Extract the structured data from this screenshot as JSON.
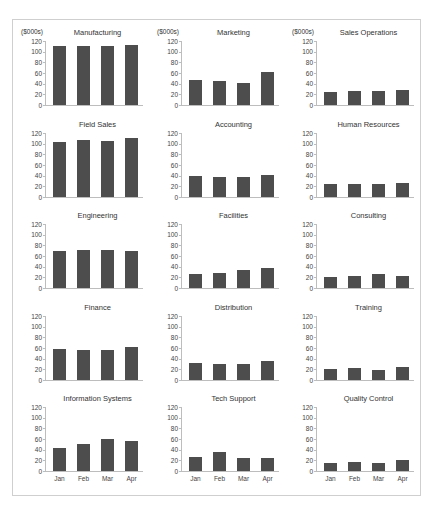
{
  "page": {
    "units_label": "($000s)",
    "month_labels": [
      "Jan",
      "Feb",
      "Mar",
      "Apr"
    ],
    "y_ticks": [
      "120",
      "100",
      "80",
      "60",
      "40",
      "20",
      "0"
    ],
    "bar_color": "#4d4d4d",
    "axis_color": "#bdbdbd",
    "frame_border_color": "#cfcfcf"
  },
  "chart_data": [
    {
      "type": "bar",
      "title": "Manufacturing",
      "ylabel": "($000s)",
      "categories": [
        "Jan",
        "Feb",
        "Mar",
        "Apr"
      ],
      "values": [
        110,
        111,
        110,
        113
      ],
      "ylim": [
        0,
        120
      ]
    },
    {
      "type": "bar",
      "title": "Marketing",
      "ylabel": "($000s)",
      "categories": [
        "Jan",
        "Feb",
        "Mar",
        "Apr"
      ],
      "values": [
        46,
        45,
        42,
        62
      ],
      "ylim": [
        0,
        120
      ]
    },
    {
      "type": "bar",
      "title": "Sales Operations",
      "ylabel": "($000s)",
      "categories": [
        "Jan",
        "Feb",
        "Mar",
        "Apr"
      ],
      "values": [
        25,
        27,
        27,
        28
      ],
      "ylim": [
        0,
        120
      ]
    },
    {
      "type": "bar",
      "title": "Field Sales",
      "ylabel": "",
      "categories": [
        "Jan",
        "Feb",
        "Mar",
        "Apr"
      ],
      "values": [
        103,
        106,
        105,
        111
      ],
      "ylim": [
        0,
        120
      ]
    },
    {
      "type": "bar",
      "title": "Accounting",
      "ylabel": "",
      "categories": [
        "Jan",
        "Feb",
        "Mar",
        "Apr"
      ],
      "values": [
        39,
        37,
        38,
        41
      ],
      "ylim": [
        0,
        120
      ]
    },
    {
      "type": "bar",
      "title": "Human Resources",
      "ylabel": "",
      "categories": [
        "Jan",
        "Feb",
        "Mar",
        "Apr"
      ],
      "values": [
        25,
        25,
        25,
        27
      ],
      "ylim": [
        0,
        120
      ]
    },
    {
      "type": "bar",
      "title": "Engineering",
      "ylabel": "",
      "categories": [
        "Jan",
        "Feb",
        "Mar",
        "Apr"
      ],
      "values": [
        70,
        72,
        71,
        70
      ],
      "ylim": [
        0,
        120
      ]
    },
    {
      "type": "bar",
      "title": "Facilities",
      "ylabel": "",
      "categories": [
        "Jan",
        "Feb",
        "Mar",
        "Apr"
      ],
      "values": [
        27,
        29,
        34,
        37
      ],
      "ylim": [
        0,
        120
      ]
    },
    {
      "type": "bar",
      "title": "Consulting",
      "ylabel": "",
      "categories": [
        "Jan",
        "Feb",
        "Mar",
        "Apr"
      ],
      "values": [
        21,
        22,
        26,
        22
      ],
      "ylim": [
        0,
        120
      ]
    },
    {
      "type": "bar",
      "title": "Finance",
      "ylabel": "",
      "categories": [
        "Jan",
        "Feb",
        "Mar",
        "Apr"
      ],
      "values": [
        59,
        57,
        56,
        62
      ],
      "ylim": [
        0,
        120
      ]
    },
    {
      "type": "bar",
      "title": "Distribution",
      "ylabel": "",
      "categories": [
        "Jan",
        "Feb",
        "Mar",
        "Apr"
      ],
      "values": [
        31,
        30,
        30,
        35
      ],
      "ylim": [
        0,
        120
      ]
    },
    {
      "type": "bar",
      "title": "Training",
      "ylabel": "",
      "categories": [
        "Jan",
        "Feb",
        "Mar",
        "Apr"
      ],
      "values": [
        21,
        22,
        18,
        24
      ],
      "ylim": [
        0,
        120
      ]
    },
    {
      "type": "bar",
      "title": "Information Systems",
      "ylabel": "",
      "categories": [
        "Jan",
        "Feb",
        "Mar",
        "Apr"
      ],
      "values": [
        44,
        51,
        60,
        57
      ],
      "ylim": [
        0,
        120
      ],
      "show_x_labels": true
    },
    {
      "type": "bar",
      "title": "Tech Support",
      "ylabel": "",
      "categories": [
        "Jan",
        "Feb",
        "Mar",
        "Apr"
      ],
      "values": [
        26,
        36,
        25,
        25
      ],
      "ylim": [
        0,
        120
      ],
      "show_x_labels": true
    },
    {
      "type": "bar",
      "title": "Quality Control",
      "ylabel": "",
      "categories": [
        "Jan",
        "Feb",
        "Mar",
        "Apr"
      ],
      "values": [
        15,
        16,
        15,
        20
      ],
      "ylim": [
        0,
        120
      ],
      "show_x_labels": true
    }
  ]
}
